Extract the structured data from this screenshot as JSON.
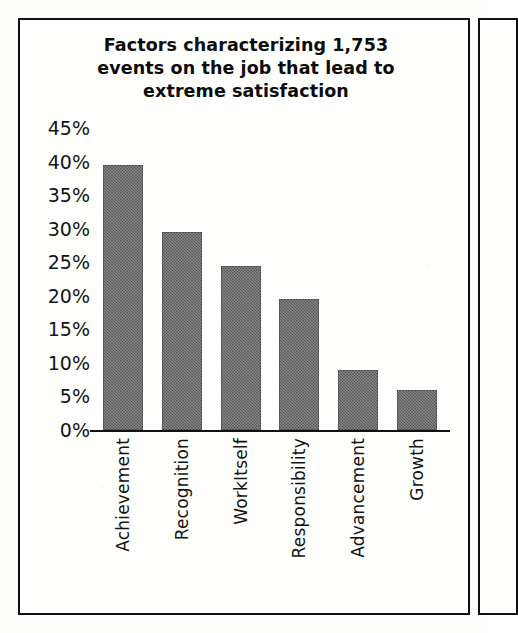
{
  "figure": {
    "title": "Factors characterizing 1,753 events on the job that lead to extreme satisfaction",
    "title_line_1": "Factors characterizing 1,753",
    "title_line_2": "events on the job that lead to",
    "title_line_3": "extreme satisfaction",
    "border_color": "#111111",
    "background_color": "#fffffd"
  },
  "colors": {
    "bar_fill": "#5b5b5b",
    "axis": "#111111",
    "text": "#121212"
  },
  "chart_data": {
    "type": "bar",
    "title": "Factors characterizing 1,753 events on the job that lead to extreme satisfaction",
    "xlabel": "",
    "ylabel": "",
    "categories": [
      "Achievement",
      "Recognition",
      "WorkItself",
      "Responsibility",
      "Advancement",
      "Growth"
    ],
    "values": [
      39.5,
      29.5,
      24.5,
      19.5,
      9.0,
      6.0
    ],
    "value_labels": [
      "39.5%",
      "29.5%",
      "24.5%",
      "19.5%",
      "9%",
      "6%"
    ],
    "ylim": [
      0,
      45
    ],
    "ytick_values": [
      45,
      40,
      35,
      30,
      25,
      20,
      15,
      10,
      5,
      0
    ],
    "ytick_labels": [
      "45%",
      "40%",
      "35%",
      "30%",
      "25%",
      "20%",
      "15%",
      "10%",
      "5%",
      "0%"
    ],
    "grid": false,
    "legend": null,
    "orientation": "vertical",
    "series": [
      {
        "name": "Percent of events leading to extreme satisfaction",
        "values": [
          39.5,
          29.5,
          24.5,
          19.5,
          9.0,
          6.0
        ]
      }
    ]
  }
}
